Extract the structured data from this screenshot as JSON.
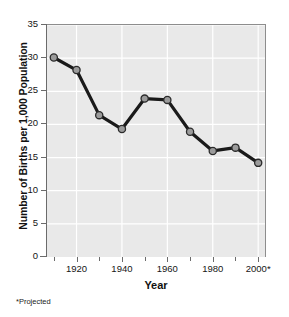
{
  "chart_data": {
    "type": "line",
    "title": "",
    "xlabel": "Year",
    "ylabel": "Number of Births per 1,000 Population",
    "footnote": "*Projected",
    "x": [
      1910,
      1920,
      1930,
      1940,
      1950,
      1960,
      1970,
      1980,
      1990,
      2000
    ],
    "values": [
      30.1,
      28.2,
      21.4,
      19.3,
      23.9,
      23.7,
      18.9,
      16.0,
      16.5,
      14.2
    ],
    "series": [
      {
        "name": "Number of Births per 1,000 Population",
        "values": [
          30.1,
          28.2,
          21.4,
          19.3,
          23.9,
          23.7,
          18.9,
          16.0,
          16.5,
          14.2
        ]
      }
    ],
    "xlim": [
      1907,
      2003
    ],
    "ylim": [
      0,
      35
    ],
    "yticks": [
      0,
      5,
      10,
      15,
      20,
      25,
      30,
      35
    ],
    "ytick_labels": [
      "0",
      "5",
      "10",
      "15",
      "20",
      "25",
      "30",
      "35"
    ],
    "xticks": [
      1920,
      1940,
      1960,
      1980,
      2000
    ],
    "xtick_labels": [
      "1920",
      "1940",
      "1960",
      "1980",
      "2000*"
    ],
    "xticks_minor": [
      1910,
      1930,
      1950,
      1970,
      1990
    ],
    "grid": true,
    "grid_color": "#ffffff",
    "plot_background": "#e9e9e9",
    "line_color": "#1a1a1a",
    "marker_fill": "#9b9b9b",
    "marker_edge": "#2b2b2b",
    "legend": null
  }
}
